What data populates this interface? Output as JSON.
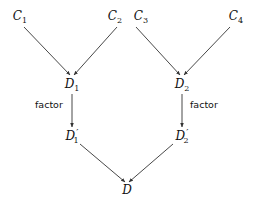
{
  "diagram": {
    "type": "tree",
    "nodes": {
      "c1": {
        "name": "C",
        "sub": "1",
        "prime": ""
      },
      "c2": {
        "name": "C",
        "sub": "2",
        "prime": ""
      },
      "c3": {
        "name": "C",
        "sub": "3",
        "prime": ""
      },
      "c4": {
        "name": "C",
        "sub": "4",
        "prime": ""
      },
      "d1": {
        "name": "D",
        "sub": "1",
        "prime": ""
      },
      "d2": {
        "name": "D",
        "sub": "2",
        "prime": ""
      },
      "d1p": {
        "name": "D",
        "sub": "1",
        "prime": "′"
      },
      "d2p": {
        "name": "D",
        "sub": "2",
        "prime": "′"
      },
      "d": {
        "name": "D",
        "sub": "",
        "prime": ""
      }
    },
    "edges": [
      {
        "from": "C1",
        "to": "D1",
        "label": ""
      },
      {
        "from": "C2",
        "to": "D1",
        "label": ""
      },
      {
        "from": "C3",
        "to": "D2",
        "label": ""
      },
      {
        "from": "C4",
        "to": "D2",
        "label": ""
      },
      {
        "from": "D1",
        "to": "D1'",
        "label": "factor"
      },
      {
        "from": "D2",
        "to": "D2'",
        "label": "factor"
      },
      {
        "from": "D1'",
        "to": "D",
        "label": ""
      },
      {
        "from": "D2'",
        "to": "D",
        "label": ""
      }
    ],
    "edge_labels": {
      "left_factor": "factor",
      "right_factor": "factor"
    },
    "colors": {
      "stroke": "#333333",
      "text": "#111111",
      "background": "#ffffff"
    }
  }
}
